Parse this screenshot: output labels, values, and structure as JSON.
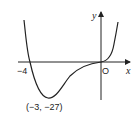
{
  "diagram": {
    "type": "function-graph",
    "axes": {
      "x_label": "x",
      "y_label": "y",
      "origin_label": "O"
    },
    "points": {
      "x_intercept_label": "−4",
      "minimum_label": "(−3, −27)"
    },
    "colors": {
      "line": "#222222",
      "background": "#ffffff"
    }
  }
}
